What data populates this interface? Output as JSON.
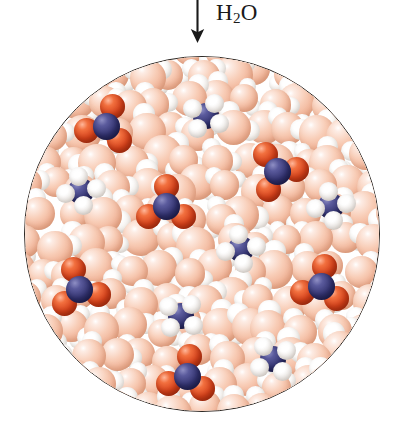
{
  "figure": {
    "solvent_label": "H",
    "solvent_sub": "2",
    "solvent_label_tail": "O",
    "solvent_formula": "H2O",
    "arrow_direction": "down"
  },
  "colors": {
    "nitrogen": "#353572",
    "oxygen": "#d8431c",
    "hydrogen": "#ffffff",
    "water_oxygen": "#f8cdb7",
    "circle_outline": "#2b2622",
    "background": "#ffffff",
    "text": "#1a1a1a"
  },
  "container": {
    "shape": "circle",
    "center_x": 202,
    "center_y": 234,
    "radius": 178
  },
  "legend": {
    "nitrate_name": "nitrate ion",
    "nitrate_formula": "NO3-",
    "ammonium_name": "ammonium ion",
    "ammonium_formula": "NH4+",
    "water_name": "water molecule",
    "water_formula": "H2O"
  },
  "ions": [
    {
      "type": "nitrate",
      "x": 105,
      "y": 125,
      "rot": 18
    },
    {
      "type": "ammonium",
      "x": 205,
      "y": 115,
      "rot": 12
    },
    {
      "type": "nitrate",
      "x": 276,
      "y": 170,
      "rot": 205
    },
    {
      "type": "ammonium",
      "x": 80,
      "y": 190,
      "rot": 150
    },
    {
      "type": "nitrate",
      "x": 165,
      "y": 205,
      "rot": 0
    },
    {
      "type": "ammonium",
      "x": 330,
      "y": 205,
      "rot": 60
    },
    {
      "type": "ammonium",
      "x": 240,
      "y": 248,
      "rot": 330
    },
    {
      "type": "nitrate",
      "x": 78,
      "y": 288,
      "rot": 105
    },
    {
      "type": "nitrate",
      "x": 320,
      "y": 285,
      "rot": 250
    },
    {
      "type": "ammonium",
      "x": 180,
      "y": 315,
      "rot": 200
    },
    {
      "type": "ammonium",
      "x": 272,
      "y": 358,
      "rot": 35
    },
    {
      "type": "nitrate",
      "x": 186,
      "y": 375,
      "rot": 8
    }
  ],
  "water_seed": 20240917,
  "water_count": 150
}
